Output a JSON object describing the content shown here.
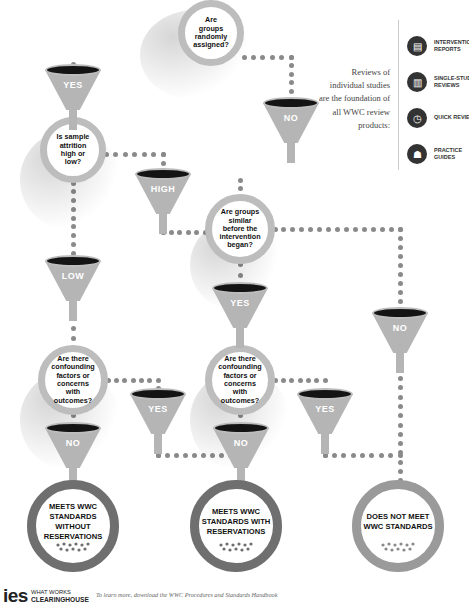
{
  "questions": {
    "q1": "Are groups randomly assigned?",
    "q2": "Is sample attrition high or low?",
    "q3": "Are groups similar before the intervention began?",
    "q4": "Are there confounding factors or concerns with outcomes?",
    "q5": "Are there confounding factors or concerns with outcomes?"
  },
  "funnels": {
    "f_yes_1": "YES",
    "f_no_1": "NO",
    "f_high": "HIGH",
    "f_low": "LOW",
    "f_yes_2": "YES",
    "f_no_right": "NO",
    "f_no_left": "NO",
    "f_yes_left": "YES",
    "f_no_mid": "NO",
    "f_yes_right": "YES"
  },
  "results": {
    "r1": "MEETS WWC STANDARDS WITHOUT RESERVATIONS",
    "r2": "MEETS WWC STANDARDS WITH RESERVATIONS",
    "r3": "DOES NOT MEET WWC STANDARDS"
  },
  "sidebar": {
    "intro": "Reviews of individual studies are the foundation of all WWC review products:",
    "products": [
      {
        "icon": "report-icon",
        "label": "INTERVENTION REPORTS"
      },
      {
        "icon": "chart-document-icon",
        "label": "SINGLE-STUDY REVIEWS"
      },
      {
        "icon": "stopwatch-icon",
        "label": "QUICK REVIEWS"
      },
      {
        "icon": "person-laptop-icon",
        "label": "PRACTICE GUIDES"
      }
    ]
  },
  "footer": {
    "logo_ies": "ies",
    "logo_line1": "WHAT WORKS",
    "logo_line2": "CLEARINGHOUSE",
    "note": "To learn more, download the WWC Procedures and Standards Handbook"
  },
  "colors": {
    "ring_light": "#bdbdbd",
    "ring_dark": "#6f6f6f",
    "funnel": "#b5b5b5",
    "funnel_mouth": "#141414",
    "dot": "#8a8a8a"
  }
}
